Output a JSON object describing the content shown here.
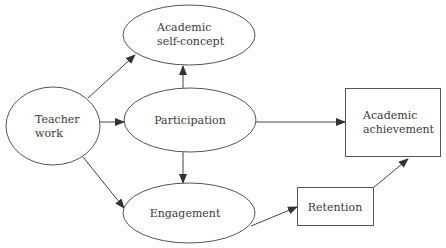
{
  "diagram": {
    "type": "path-diagram",
    "nodes": {
      "teacher_work": {
        "line1": "Teacher",
        "line2": "work",
        "shape": "ellipse"
      },
      "self_concept": {
        "line1": "Academic",
        "line2": "self-concept",
        "shape": "ellipse"
      },
      "participation": {
        "label": "Participation",
        "shape": "ellipse"
      },
      "engagement": {
        "label": "Engagement",
        "shape": "ellipse"
      },
      "retention": {
        "label": "Retention",
        "shape": "rectangle"
      },
      "achievement": {
        "line1": "Academic",
        "line2": "achievement",
        "shape": "rectangle"
      }
    },
    "edges": [
      {
        "from": "Teacher work",
        "to": "Academic self-concept"
      },
      {
        "from": "Teacher work",
        "to": "Participation"
      },
      {
        "from": "Teacher work",
        "to": "Engagement"
      },
      {
        "from": "Participation",
        "to": "Academic self-concept"
      },
      {
        "from": "Participation",
        "to": "Engagement"
      },
      {
        "from": "Participation",
        "to": "Academic achievement"
      },
      {
        "from": "Engagement",
        "to": "Retention"
      },
      {
        "from": "Retention",
        "to": "Academic achievement"
      }
    ],
    "colors": {
      "stroke": "#555555",
      "text": "#3a3a3a",
      "background": "#ffffff"
    }
  }
}
